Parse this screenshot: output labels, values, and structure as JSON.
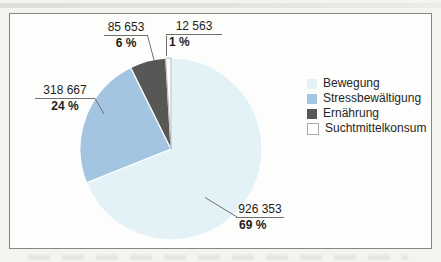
{
  "figure": {
    "inner_background": "#fdfdfc",
    "frame_border_color": "#868686",
    "leader_line_color": "#6f6f6f",
    "text_color": "#1d1d1b"
  },
  "chart_data": {
    "type": "pie",
    "title": "",
    "total": 1343236,
    "start_angle_deg": 0,
    "direction": "clockwise",
    "legend_position": "right",
    "segments": [
      {
        "label": "Bewegung",
        "value": 926353,
        "value_label": "926 353",
        "pct": 69,
        "pct_label": "69 %",
        "color": "#e3f2f7"
      },
      {
        "label": "Stressbewältigung",
        "value": 318667,
        "value_label": "318 667",
        "pct": 24,
        "pct_label": "24 %",
        "color": "#a3c5e2"
      },
      {
        "label": "Ernährung",
        "value": 85653,
        "value_label": "85 653",
        "pct": 6,
        "pct_label": "6 %",
        "color": "#575756"
      },
      {
        "label": "Suchtmittelkonsum",
        "value": 12563,
        "value_label": "12 563",
        "pct": 1,
        "pct_label": "1 %",
        "color": "#ffffff"
      }
    ]
  }
}
